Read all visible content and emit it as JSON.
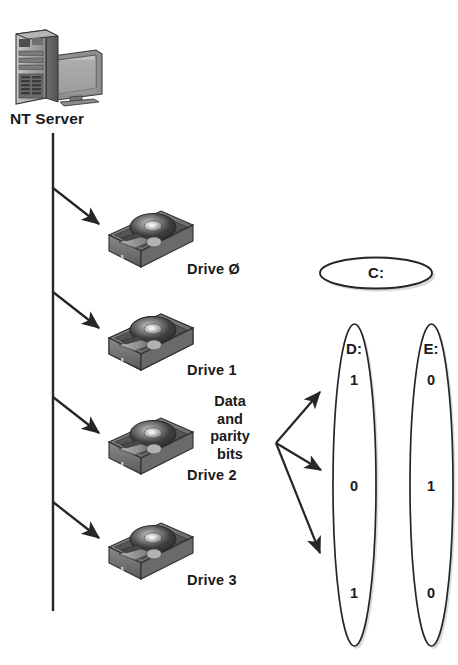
{
  "diagram": {
    "background_color": "#ffffff",
    "ink_color": "#1a1a1a"
  },
  "server": {
    "label": "NT Server",
    "icon": "server-tower-and-monitor-icon"
  },
  "drives": [
    {
      "label": "Drive Ø",
      "icon": "hard-disk-drive-icon"
    },
    {
      "label": "Drive 1",
      "icon": "hard-disk-drive-icon"
    },
    {
      "label": "Drive 2",
      "icon": "hard-disk-drive-icon"
    },
    {
      "label": "Drive 3",
      "icon": "hard-disk-drive-icon"
    }
  ],
  "annotation": {
    "parity_label": "Data\nand\nparity\nbits"
  },
  "volumes": {
    "c": {
      "label": "C:",
      "shape": "horizontal-ellipse"
    },
    "d": {
      "label": "D:",
      "shape": "vertical-ellipse",
      "bits": [
        "1",
        "0",
        "1"
      ]
    },
    "e": {
      "label": "E:",
      "shape": "vertical-ellipse",
      "bits": [
        "0",
        "1",
        "0"
      ]
    }
  }
}
